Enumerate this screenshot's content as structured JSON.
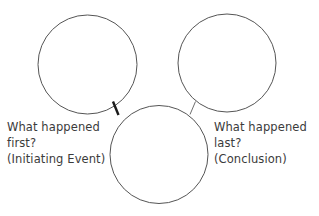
{
  "page": {
    "background_color": "#ffffff",
    "width": 319,
    "height": 216
  },
  "diagram": {
    "type": "sequence-chain-organizer",
    "stroke_color": "#555555",
    "connector_dark_color": "#1a1a1a",
    "connector_light_color": "#6e6e6e",
    "fill_color": "#ffffff",
    "circles": [
      {
        "name": "first-event-circle",
        "role": "initiating-event",
        "cx": 87.5,
        "cy": 64.5,
        "r": 49.5,
        "stroke_width": 1
      },
      {
        "name": "last-event-circle",
        "role": "conclusion",
        "cx": 227,
        "cy": 63,
        "r": 49,
        "stroke_width": 1
      },
      {
        "name": "middle-event-circle",
        "role": "middle-event",
        "cx": 159,
        "cy": 154.5,
        "r": 49,
        "stroke_width": 1
      }
    ],
    "connectors": [
      {
        "name": "connector-first-to-middle",
        "x1": 113,
        "y1": 101.5,
        "x2": 118.5,
        "y2": 115,
        "stroke_width": 2.4,
        "color": "#1a1a1a"
      },
      {
        "name": "connector-middle-to-last",
        "x1": 195.5,
        "y1": 101.5,
        "x2": 190,
        "y2": 114.5,
        "stroke_width": 1,
        "color": "#6e6e6e"
      }
    ]
  },
  "labels": {
    "left": {
      "name": "first-event-label",
      "line1": "What happened",
      "line2": "first?",
      "line3": "(Initiating Event)"
    },
    "right": {
      "name": "last-event-label",
      "line1": "What happened",
      "line2": "last?",
      "line3": "(Conclusion)"
    }
  }
}
